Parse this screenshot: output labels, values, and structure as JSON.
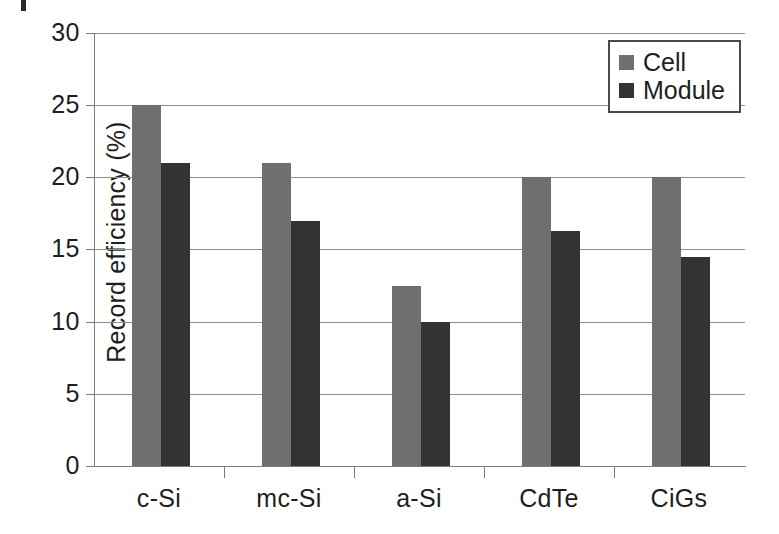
{
  "chart_data": {
    "type": "bar",
    "title": "",
    "subtitle": "",
    "xlabel": "",
    "ylabel": "Record efficiency (%)",
    "categories": [
      "c-Si",
      "mc-Si",
      "a-Si",
      "CdTe",
      "CiGs"
    ],
    "series": [
      {
        "name": "Cell",
        "color": "#6f6f6f",
        "values": [
          25.0,
          21.0,
          12.5,
          20.0,
          20.0
        ]
      },
      {
        "name": "Module",
        "color": "#333333",
        "values": [
          21.0,
          17.0,
          10.0,
          16.3,
          14.5
        ]
      }
    ],
    "ylim": [
      0,
      30
    ],
    "yticks": [
      0,
      5,
      10,
      15,
      20,
      25,
      30
    ],
    "ytick_labels": [
      "0",
      "5",
      "10",
      "15",
      "20",
      "25",
      "30"
    ],
    "grid": "horizontal",
    "legend_position": "top-right",
    "annotations": []
  },
  "legend": {
    "entries": [
      {
        "label": "Cell",
        "swatch": "cell-swatch-icon"
      },
      {
        "label": "Module",
        "swatch": "module-swatch-icon"
      }
    ]
  }
}
